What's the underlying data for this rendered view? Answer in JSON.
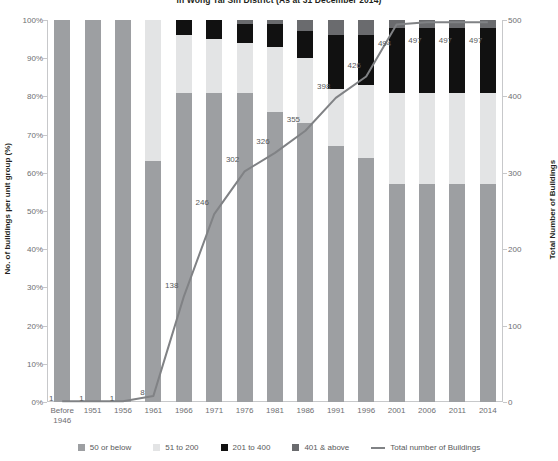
{
  "chart_data": {
    "type": "bar",
    "title": "in Wong Tai Sin District (As at 31 December 2014)",
    "xlabel": "",
    "ylabel": "No. of buildings per unit group (%)",
    "y2label": "Total Number of Buildings",
    "ylim": [
      0,
      100
    ],
    "y2lim": [
      0,
      500
    ],
    "grid": false,
    "legend_position": "bottom",
    "stacked": true,
    "stack_mode": "percent",
    "categories": [
      "Before 1946",
      "1951",
      "1956",
      "1961",
      "1966",
      "1971",
      "1976",
      "1981",
      "1986",
      "1991",
      "1996",
      "2001",
      "2006",
      "2011",
      "2014"
    ],
    "category_labels": [
      "Before\n1946",
      "1951",
      "1956",
      "1961",
      "1966",
      "1971",
      "1976",
      "1981",
      "1986",
      "1991",
      "1996",
      "2001",
      "2006",
      "2011",
      "2014"
    ],
    "yticks": [
      "0%",
      "10%",
      "20%",
      "30%",
      "40%",
      "50%",
      "60%",
      "70%",
      "80%",
      "90%",
      "100%"
    ],
    "ytick_values": [
      0,
      10,
      20,
      30,
      40,
      50,
      60,
      70,
      80,
      90,
      100
    ],
    "y2ticks": [
      "0",
      "100",
      "200",
      "300",
      "400",
      "500"
    ],
    "y2tick_values": [
      0,
      100,
      200,
      300,
      400,
      500
    ],
    "series": [
      {
        "name": "50 or below",
        "color": "#9d9fa2",
        "values": [
          100,
          100,
          100,
          63,
          81,
          81,
          81,
          76,
          73,
          67,
          64,
          57,
          57,
          57,
          57
        ]
      },
      {
        "name": "51 to 200",
        "color": "#e3e4e5",
        "values": [
          0,
          0,
          0,
          37,
          15,
          14,
          13,
          17,
          17,
          15,
          19,
          24,
          24,
          24,
          24
        ]
      },
      {
        "name": "201 to 400",
        "color": "#111111",
        "values": [
          0,
          0,
          0,
          0,
          4,
          5,
          5,
          6,
          7,
          14,
          13,
          17,
          17,
          17,
          17
        ]
      },
      {
        "name": "401 & above",
        "color": "#6a6b6e",
        "values": [
          0,
          0,
          0,
          0,
          0,
          0,
          1,
          1,
          3,
          4,
          4,
          2,
          2,
          2,
          2
        ]
      }
    ],
    "line_series": {
      "name": "Total number of Buildings",
      "color": "#808285",
      "axis": "y2",
      "values": [
        1,
        1,
        1,
        8,
        138,
        246,
        302,
        326,
        355,
        398,
        426,
        494,
        497,
        497,
        497
      ],
      "labels": [
        "1",
        "1",
        "1",
        "8",
        "138",
        "246",
        "302",
        "326",
        "355",
        "398",
        "426",
        "494",
        "497",
        "497",
        "497"
      ]
    },
    "legend": [
      {
        "label": "50 or below",
        "color": "#9d9fa2",
        "marker": "square"
      },
      {
        "label": "51 to 200",
        "color": "#e3e4e5",
        "marker": "square"
      },
      {
        "label": "201 to 400",
        "color": "#111111",
        "marker": "square"
      },
      {
        "label": "401 & above",
        "color": "#6a6b6e",
        "marker": "square"
      },
      {
        "label": "Total number of Buildings",
        "color": "#808285",
        "marker": "line"
      }
    ]
  },
  "colors": {
    "axis": "#c7c8ca",
    "tick_text": "#6d6e71",
    "title_text": "#231f20",
    "label_text": "#58595b",
    "background": "#ffffff"
  }
}
